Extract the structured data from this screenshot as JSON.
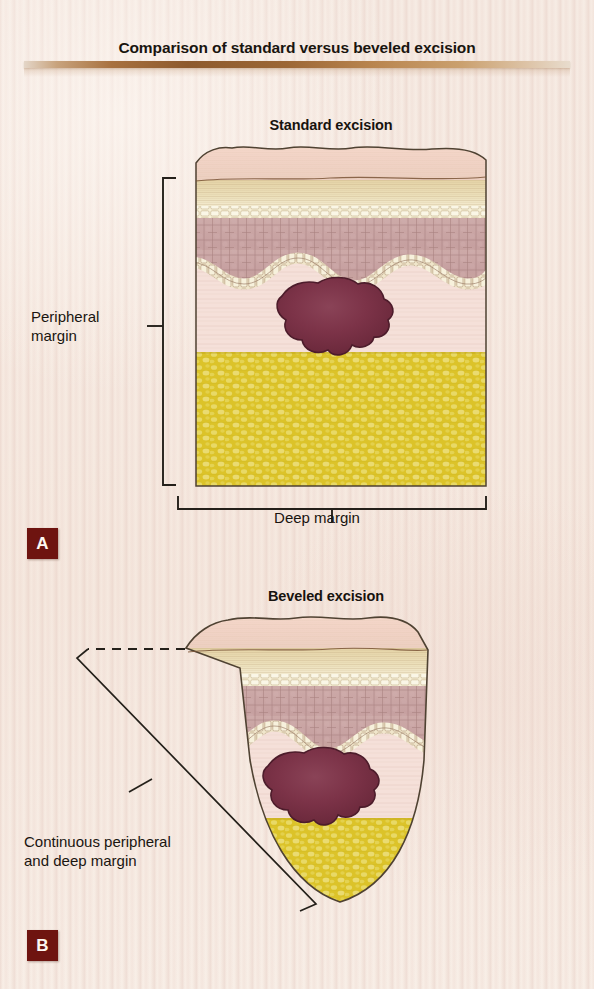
{
  "figure": {
    "title": "Comparison of standard versus beveled excision",
    "background_color": "#f5e9e0",
    "rule_color": "#8d5a2d"
  },
  "panels": [
    {
      "letter": "A",
      "heading": "Standard excision",
      "shape": "rectangular-block",
      "badge_color": "#6e1410",
      "callouts": [
        {
          "name": "peripheral-margin",
          "text": "Peripheral\nmargin",
          "bracket": "vertical-left"
        },
        {
          "name": "deep-margin",
          "text": "Deep margin",
          "bracket": "horizontal-bottom"
        }
      ],
      "tissue_layers": [
        {
          "name": "stratum-corneum",
          "color": "#f0cfc4"
        },
        {
          "name": "granular-layer",
          "color": "#e8d9b4"
        },
        {
          "name": "pale-band",
          "color": "#f5efd8"
        },
        {
          "name": "spinous-layer",
          "color": "#c8a3a4"
        },
        {
          "name": "basal-layer",
          "color": "#eee3c8"
        },
        {
          "name": "dermis",
          "color": "#f3ddd8"
        },
        {
          "name": "subcutaneous-fat",
          "color": "#ddc22c"
        }
      ],
      "lesion": {
        "name": "melanoma-lesion",
        "color": "#7a3246",
        "depth": "reaches-fat-interface"
      }
    },
    {
      "letter": "B",
      "heading": "Beveled excision",
      "shape": "tapered-bowl",
      "badge_color": "#6e1410",
      "callouts": [
        {
          "name": "continuous-margin",
          "text": "Continuous peripheral\nand deep margin",
          "bracket": "angled-diagonal"
        }
      ],
      "tissue_layers": [
        {
          "name": "stratum-corneum",
          "color": "#f0cfc4"
        },
        {
          "name": "granular-layer",
          "color": "#e8d9b4"
        },
        {
          "name": "pale-band",
          "color": "#f5efd8"
        },
        {
          "name": "spinous-layer",
          "color": "#c8a3a4"
        },
        {
          "name": "basal-layer",
          "color": "#eee3c8"
        },
        {
          "name": "dermis",
          "color": "#f3ddd8"
        },
        {
          "name": "subcutaneous-fat",
          "color": "#ddc22c"
        }
      ],
      "lesion": {
        "name": "melanoma-lesion",
        "color": "#7a3246",
        "depth": "reaches-fat-interface"
      }
    }
  ]
}
